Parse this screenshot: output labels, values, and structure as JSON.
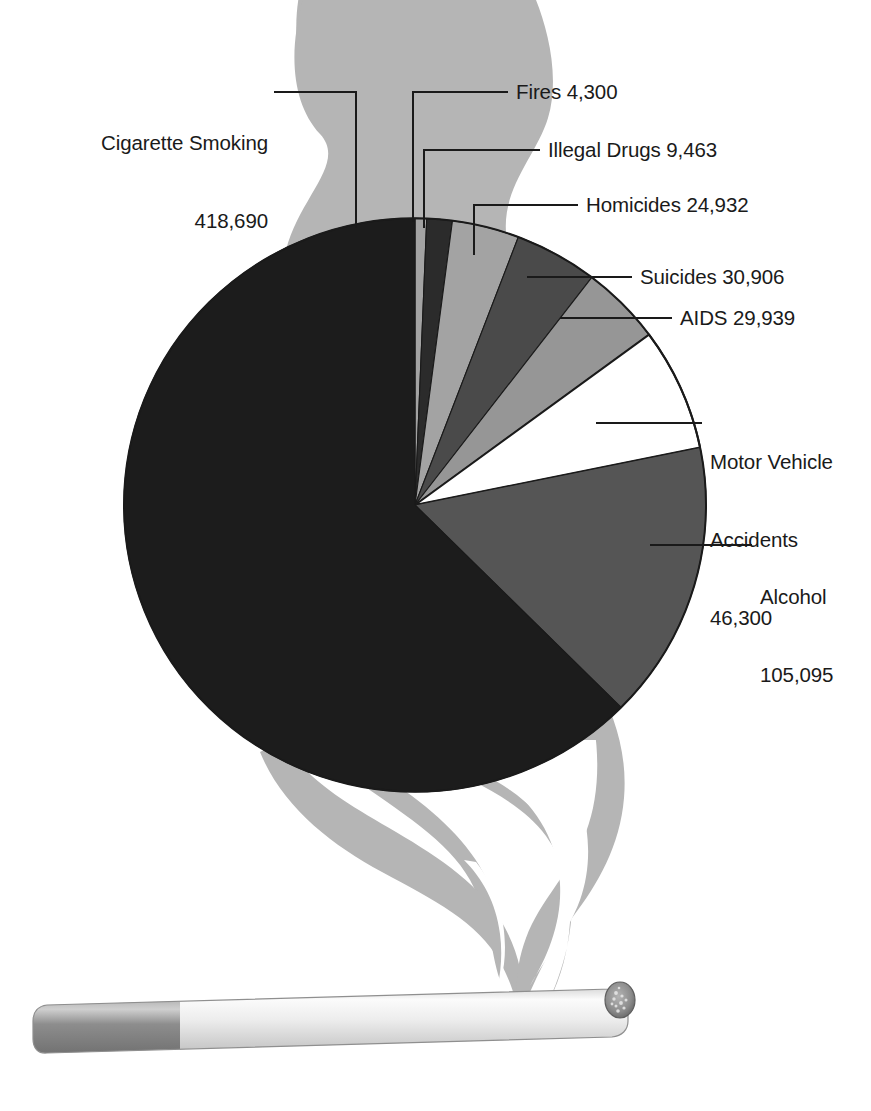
{
  "figure": {
    "background_color": "#ffffff",
    "smoke_color": "#b5b5b5",
    "line_color": "#1a1a1a",
    "text_color": "#1a1a1a"
  },
  "chart_data": {
    "type": "pie",
    "title": "",
    "xlabel": "",
    "ylabel": "",
    "total": 669625,
    "start_angle_deg": 0,
    "direction": "clockwise",
    "legend": "none",
    "grid": false,
    "categories": [
      "Fires",
      "Illegal Drugs",
      "Homicides",
      "Suicides",
      "AIDS",
      "Motor Vehicle Accidents",
      "Alcohol",
      "Cigarette Smoking"
    ],
    "values": [
      4300,
      9463,
      24932,
      30906,
      29939,
      46300,
      105095,
      418690
    ],
    "value_labels": [
      "4,300",
      "9,463",
      "24,932",
      "30,906",
      "29,939",
      "46,300",
      "105,095",
      "418,690"
    ],
    "colors": [
      "#a3a3a3",
      "#2b2b2b",
      "#a3a3a3",
      "#4a4a4a",
      "#969696",
      "#ffffff",
      "#555555",
      "#1c1c1c"
    ],
    "slices": [
      {
        "name": "Fires",
        "value": 4300,
        "value_label": "4,300",
        "percent": 0.64,
        "color": "#a3a3a3",
        "start_deg": 0.0,
        "end_deg": 2.312
      },
      {
        "name": "Illegal Drugs",
        "value": 9463,
        "value_label": "9,463",
        "percent": 1.41,
        "color": "#2b2b2b",
        "start_deg": 2.312,
        "end_deg": 7.4
      },
      {
        "name": "Homicides",
        "value": 24932,
        "value_label": "24,932",
        "percent": 3.72,
        "color": "#a3a3a3",
        "start_deg": 7.4,
        "end_deg": 20.803
      },
      {
        "name": "Suicides",
        "value": 30906,
        "value_label": "30,906",
        "percent": 4.62,
        "color": "#4a4a4a",
        "start_deg": 20.803,
        "end_deg": 37.422
      },
      {
        "name": "AIDS",
        "value": 29939,
        "value_label": "29,939",
        "percent": 4.47,
        "color": "#969696",
        "start_deg": 37.422,
        "end_deg": 53.517
      },
      {
        "name": "Motor Vehicle Accidents",
        "value": 46300,
        "value_label": "46,300",
        "percent": 6.91,
        "color": "#ffffff",
        "start_deg": 53.517,
        "end_deg": 78.411
      },
      {
        "name": "Alcohol",
        "value": 105095,
        "value_label": "105,095",
        "percent": 15.69,
        "color": "#555555",
        "start_deg": 78.411,
        "end_deg": 134.923
      },
      {
        "name": "Cigarette Smoking",
        "value": 418690,
        "value_label": "418,690",
        "percent": 62.53,
        "color": "#1c1c1c",
        "start_deg": 134.923,
        "end_deg": 360.0
      }
    ]
  },
  "labels": {
    "cigarette_smoking": {
      "name": "Cigarette Smoking",
      "value": "418,690"
    },
    "fires": {
      "name": "Fires 4,300"
    },
    "illegal_drugs": {
      "name": "Illegal Drugs 9,463"
    },
    "homicides": {
      "name": "Homicides 24,932"
    },
    "suicides": {
      "name": "Suicides 30,906"
    },
    "aids": {
      "name": "AIDS 29,939"
    },
    "motor_vehicle": {
      "line1": "Motor Vehicle",
      "line2": "Accidents",
      "line3": "46,300"
    },
    "alcohol": {
      "line1": "Alcohol",
      "line2": "105,095"
    }
  },
  "decoration": {
    "cigarette": {
      "name": "cigarette-illustration",
      "filter_color": "#8a8a8a",
      "paper_color": "#f2f2f2",
      "tip_color": "#6e6e6e"
    }
  }
}
